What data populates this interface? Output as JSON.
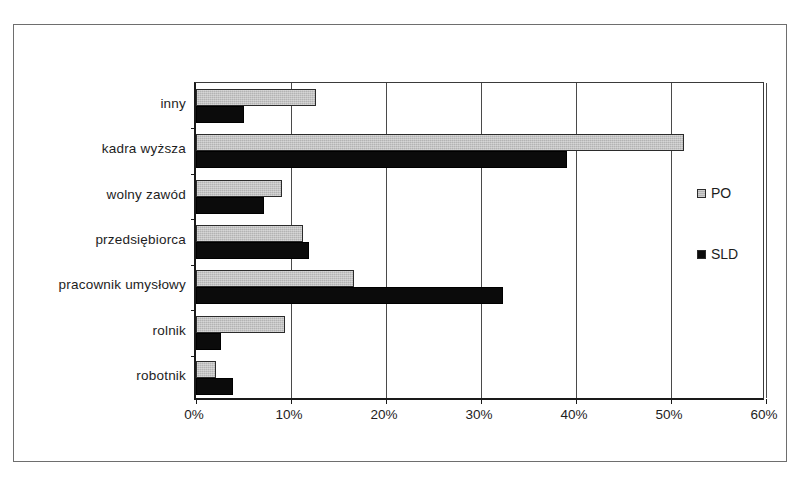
{
  "chart_data": {
    "type": "bar",
    "orientation": "horizontal",
    "title": "",
    "xlabel": "",
    "ylabel": "",
    "categories": [
      "inny",
      "kadra wyższa",
      "wolny zawód",
      "przedsiębiorca",
      "pracownik umysłowy",
      "rolnik",
      "robotnik"
    ],
    "series": [
      {
        "name": "PO",
        "color": "#b3b3b3",
        "values": [
          12.6,
          51.4,
          9.0,
          11.3,
          16.6,
          9.4,
          2.1
        ]
      },
      {
        "name": "SLD",
        "color": "#0b0b0b",
        "values": [
          5.1,
          39.1,
          7.2,
          11.9,
          32.3,
          2.6,
          3.9
        ]
      }
    ],
    "xlim": [
      0,
      60
    ],
    "xticks": [
      0,
      10,
      20,
      30,
      40,
      50,
      60
    ],
    "xtick_labels": [
      "0%",
      "10%",
      "20%",
      "30%",
      "40%",
      "50%",
      "60%"
    ],
    "grid": "vertical",
    "legend_position": "right"
  },
  "legend": {
    "entries": [
      {
        "label": "PO",
        "swatch": "legend-swatch-po"
      },
      {
        "label": "SLD",
        "swatch": "legend-swatch-sld"
      }
    ]
  },
  "caption": {
    "fragment": "Na: 1,9% 12; 1,6%"
  }
}
